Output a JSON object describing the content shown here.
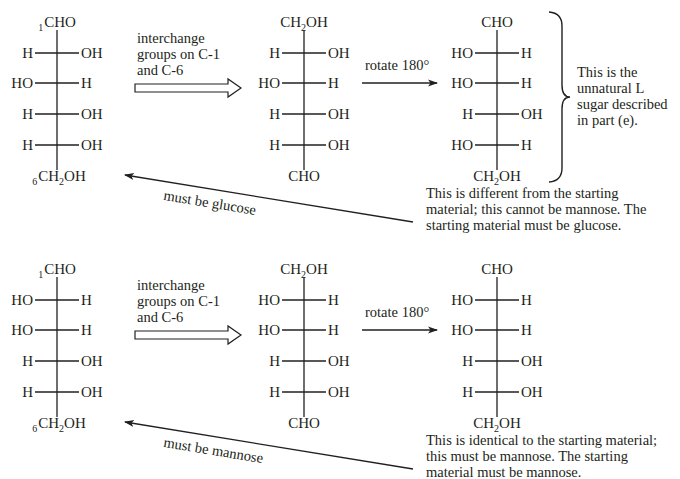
{
  "rows": [
    {
      "starting": {
        "top": {
          "number": "1",
          "group": "CHO"
        },
        "bonds": [
          {
            "left": "H",
            "right": "OH"
          },
          {
            "left": "HO",
            "right": "H"
          },
          {
            "left": "H",
            "right": "OH"
          },
          {
            "left": "H",
            "right": "OH"
          }
        ],
        "bottom": {
          "number": "6",
          "group_pre": "CH",
          "group_sub": "2",
          "group_post": "OH"
        }
      },
      "step1_label": [
        "interchange",
        "groups on C-1",
        "and C-6"
      ],
      "interchanged": {
        "top": {
          "group_pre": "CH",
          "group_sub": "2",
          "group_post": "OH"
        },
        "bonds": [
          {
            "left": "H",
            "right": "OH"
          },
          {
            "left": "HO",
            "right": "H"
          },
          {
            "left": "H",
            "right": "OH"
          },
          {
            "left": "H",
            "right": "OH"
          }
        ],
        "bottom": {
          "group": "CHO"
        }
      },
      "step2_label": "rotate 180°",
      "rotated": {
        "top": {
          "group": "CHO"
        },
        "bonds": [
          {
            "left": "HO",
            "right": "H"
          },
          {
            "left": "HO",
            "right": "H"
          },
          {
            "left": "H",
            "right": "OH"
          },
          {
            "left": "HO",
            "right": "H"
          }
        ],
        "bottom": {
          "group_pre": "CH",
          "group_sub": "2",
          "group_post": "OH"
        }
      },
      "brace_note": [
        "This is the",
        "unnatural L",
        "sugar described",
        "in part (e)."
      ],
      "conclusion": [
        "This is different from the starting",
        "material; this cannot be mannose.  The",
        "starting material must be glucose."
      ],
      "return_arrow_label": "must be glucose"
    },
    {
      "starting": {
        "top": {
          "number": "1",
          "group": "CHO"
        },
        "bonds": [
          {
            "left": "HO",
            "right": "H"
          },
          {
            "left": "HO",
            "right": "H"
          },
          {
            "left": "H",
            "right": "OH"
          },
          {
            "left": "H",
            "right": "OH"
          }
        ],
        "bottom": {
          "number": "6",
          "group_pre": "CH",
          "group_sub": "2",
          "group_post": "OH"
        }
      },
      "step1_label": [
        "interchange",
        "groups on C-1",
        "and C-6"
      ],
      "interchanged": {
        "top": {
          "group_pre": "CH",
          "group_sub": "2",
          "group_post": "OH"
        },
        "bonds": [
          {
            "left": "HO",
            "right": "H"
          },
          {
            "left": "HO",
            "right": "H"
          },
          {
            "left": "H",
            "right": "OH"
          },
          {
            "left": "H",
            "right": "OH"
          }
        ],
        "bottom": {
          "group": "CHO"
        }
      },
      "step2_label": "rotate 180°",
      "rotated": {
        "top": {
          "group": "CHO"
        },
        "bonds": [
          {
            "left": "HO",
            "right": "H"
          },
          {
            "left": "HO",
            "right": "H"
          },
          {
            "left": "H",
            "right": "OH"
          },
          {
            "left": "H",
            "right": "OH"
          }
        ],
        "bottom": {
          "group_pre": "CH",
          "group_sub": "2",
          "group_post": "OH"
        }
      },
      "conclusion": [
        "This is identical to the starting material;",
        "this must be mannose.  The starting",
        "material must be mannose."
      ],
      "return_arrow_label": "must be mannose"
    }
  ]
}
